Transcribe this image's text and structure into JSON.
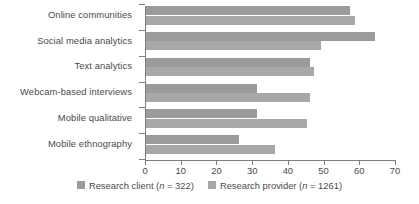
{
  "chart_data": {
    "type": "bar",
    "orientation": "horizontal",
    "title": "",
    "subtitle": "",
    "xlabel": "",
    "ylabel": "",
    "xlim": [
      0,
      70
    ],
    "xticks": [
      0,
      10,
      20,
      30,
      40,
      50,
      60,
      70
    ],
    "xtick_labels": [
      "0",
      "10",
      "20",
      "30",
      "40",
      "50",
      "60",
      "70"
    ],
    "grid": false,
    "legend_position": "bottom",
    "categories": [
      "Online communities",
      "Social media analytics",
      "Text analytics",
      "Webcam-based interviews",
      "Mobile qualitative",
      "Mobile ethnography"
    ],
    "series": [
      {
        "name": "Research client (n = 322)",
        "color": "#9b9b9b",
        "values": [
          57,
          64,
          46,
          31,
          31,
          26
        ]
      },
      {
        "name": "Research provider (n = 1261)",
        "color": "#a8a8a8",
        "values": [
          58.5,
          49,
          47,
          46,
          45,
          36
        ]
      }
    ]
  },
  "legend": {
    "items": [
      {
        "prefix": "Research client (",
        "italic": "n",
        "suffix": " = 322)",
        "color": "#9b9b9b"
      },
      {
        "prefix": "Research provider (",
        "italic": "n",
        "suffix": " = 1261)",
        "color": "#a8a8a8"
      }
    ]
  }
}
